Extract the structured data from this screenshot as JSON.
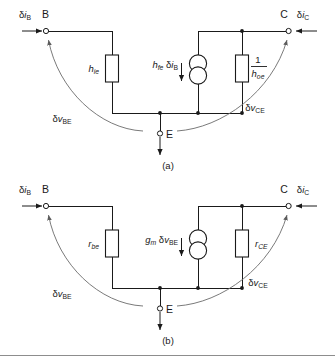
{
  "figure": {
    "line_color": "#1a1a1a",
    "arc_color": "#6b6b6b",
    "background": "#ffffff"
  },
  "circuits": [
    {
      "id": "a",
      "caption": "(a)",
      "terminals": {
        "base": "B",
        "collector": "C",
        "emitter": "E"
      },
      "currents": {
        "base_label_delta": "δ",
        "base_label_i": "i",
        "base_label_sub": "B",
        "collector_label_delta": "δ",
        "collector_label_i": "i",
        "collector_label_sub": "C"
      },
      "voltages": {
        "input_delta": "δ",
        "input_v": "v",
        "input_sub": "BE",
        "output_delta": "δ",
        "output_v": "v",
        "output_sub": "CE"
      },
      "input_resistor": {
        "symbol": "h",
        "subscript": "ie"
      },
      "source": {
        "gain_symbol": "h",
        "gain_subscript": "fe",
        "times_delta": "δ",
        "times_i": "i",
        "times_sub": "B",
        "type": "current-source"
      },
      "output_resistor": {
        "numerator": "1",
        "symbol": "h",
        "subscript": "oe",
        "form": "reciprocal"
      }
    },
    {
      "id": "b",
      "caption": "(b)",
      "terminals": {
        "base": "B",
        "collector": "C",
        "emitter": "E"
      },
      "currents": {
        "base_label_delta": "δ",
        "base_label_i": "i",
        "base_label_sub": "B",
        "collector_label_delta": "δ",
        "collector_label_i": "i",
        "collector_label_sub": "C"
      },
      "voltages": {
        "input_delta": "δ",
        "input_v": "v",
        "input_sub": "BE",
        "output_delta": "δ",
        "output_v": "v",
        "output_sub": "CE"
      },
      "input_resistor": {
        "symbol": "r",
        "subscript": "be"
      },
      "source": {
        "gain_symbol": "g",
        "gain_subscript": "m",
        "times_delta": "δ",
        "times_v": "v",
        "times_sub": "BE",
        "type": "current-source"
      },
      "output_resistor": {
        "symbol": "r",
        "subscript": "CE",
        "form": "plain"
      }
    }
  ]
}
